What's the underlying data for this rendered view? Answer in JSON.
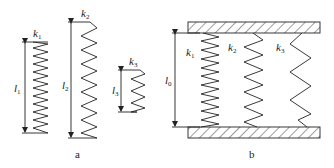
{
  "figure": {
    "panel_a": {
      "caption": "a",
      "springs": [
        {
          "stiffness_label": "k",
          "stiffness_sub": "1",
          "length_label": "l",
          "length_sub": "1",
          "coils": 16
        },
        {
          "stiffness_label": "k",
          "stiffness_sub": "2",
          "length_label": "l",
          "length_sub": "2",
          "coils": 8
        },
        {
          "stiffness_label": "k",
          "stiffness_sub": "3",
          "length_label": "l",
          "length_sub": "3",
          "coils": 4
        }
      ]
    },
    "panel_b": {
      "caption": "b",
      "length_label": "l",
      "length_sub": "0",
      "springs": [
        {
          "stiffness_label": "k",
          "stiffness_sub": "1",
          "coils": 11
        },
        {
          "stiffness_label": "k",
          "stiffness_sub": "2",
          "coils": 6
        },
        {
          "stiffness_label": "k",
          "stiffness_sub": "3",
          "coils": 4
        }
      ]
    },
    "colors": {
      "line": "#222222",
      "background": "#ffffff"
    }
  }
}
